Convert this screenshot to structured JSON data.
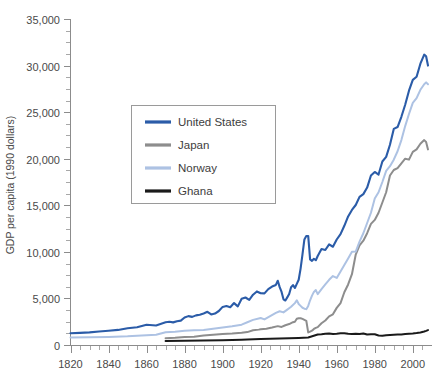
{
  "chart_data": {
    "type": "line",
    "title": "",
    "xlabel": "",
    "ylabel": "GDP per capita (1990 dollars)",
    "xlim": [
      1820,
      2008
    ],
    "ylim": [
      0,
      35000
    ],
    "grid": false,
    "legend_position": "upper-left-inset",
    "x_ticks": [
      1820,
      1840,
      1860,
      1880,
      1900,
      1920,
      1940,
      1960,
      1980,
      2000
    ],
    "x_tick_labels": [
      "1820",
      "1840",
      "1860",
      "1880",
      "1900",
      "1920",
      "1940",
      "1960",
      "1980",
      "2000"
    ],
    "x_minor_tick_interval": 5,
    "y_ticks": [
      0,
      5000,
      10000,
      15000,
      20000,
      25000,
      30000,
      35000
    ],
    "y_tick_labels": [
      "0",
      "5,000",
      "10,000",
      "15,000",
      "20,000",
      "25,000",
      "30,000",
      "35,000"
    ],
    "y_minor_tick_interval": 1250,
    "colors": {
      "united_states": "#2b5ca8",
      "japan": "#8d8d8d",
      "norway": "#adc2e3",
      "ghana": "#1a1a1a",
      "axis": "#8c8c8c",
      "text": "#4a4a4a",
      "legend_border": "#9a9a9a",
      "background": "#ffffff"
    },
    "series": [
      {
        "name": "United States",
        "color_key": "united_states",
        "x": [
          1820,
          1825,
          1830,
          1835,
          1840,
          1845,
          1850,
          1855,
          1860,
          1865,
          1870,
          1872,
          1874,
          1876,
          1878,
          1880,
          1882,
          1884,
          1886,
          1888,
          1890,
          1892,
          1894,
          1896,
          1898,
          1900,
          1902,
          1904,
          1906,
          1908,
          1910,
          1912,
          1914,
          1916,
          1918,
          1920,
          1922,
          1924,
          1926,
          1928,
          1929,
          1930,
          1931,
          1932,
          1933,
          1934,
          1935,
          1936,
          1937,
          1938,
          1939,
          1940,
          1941,
          1942,
          1943,
          1944,
          1945,
          1946,
          1947,
          1948,
          1949,
          1950,
          1952,
          1954,
          1956,
          1958,
          1960,
          1962,
          1964,
          1966,
          1968,
          1970,
          1972,
          1974,
          1976,
          1978,
          1980,
          1982,
          1984,
          1986,
          1988,
          1990,
          1992,
          1994,
          1996,
          1998,
          2000,
          2002,
          2004,
          2006,
          2007,
          2008
        ],
        "y": [
          1257,
          1300,
          1360,
          1450,
          1530,
          1620,
          1806,
          1900,
          2178,
          2100,
          2445,
          2500,
          2430,
          2550,
          2620,
          2950,
          3100,
          3020,
          3180,
          3250,
          3392,
          3560,
          3280,
          3380,
          3650,
          4091,
          4190,
          4060,
          4500,
          4150,
          4964,
          5100,
          4850,
          5400,
          5750,
          5552,
          5540,
          6000,
          6280,
          6450,
          6899,
          6213,
          5691,
          4908,
          4777,
          5114,
          5467,
          6204,
          6430,
          6126,
          6561,
          7010,
          8206,
          9741,
          11330,
          11709,
          11709,
          9197,
          9030,
          9260,
          9100,
          9561,
          10300,
          10200,
          10800,
          10550,
          11328,
          11900,
          12800,
          13800,
          14500,
          15030,
          15900,
          16200,
          16900,
          18200,
          18577,
          18300,
          19700,
          20200,
          21500,
          23201,
          23400,
          24500,
          25800,
          27300,
          28467,
          28800,
          30200,
          31178,
          31000,
          30000
        ]
      },
      {
        "name": "Japan",
        "color_key": "japan",
        "x": [
          1870,
          1875,
          1880,
          1885,
          1890,
          1895,
          1900,
          1905,
          1910,
          1913,
          1916,
          1919,
          1920,
          1923,
          1926,
          1929,
          1931,
          1933,
          1935,
          1937,
          1938,
          1939,
          1940,
          1941,
          1942,
          1943,
          1944,
          1945,
          1946,
          1947,
          1948,
          1949,
          1950,
          1952,
          1954,
          1956,
          1958,
          1960,
          1962,
          1964,
          1966,
          1968,
          1970,
          1972,
          1974,
          1976,
          1978,
          1980,
          1982,
          1984,
          1986,
          1988,
          1990,
          1992,
          1994,
          1996,
          1998,
          2000,
          2002,
          2004,
          2006,
          2007,
          2008
        ],
        "y": [
          737,
          780,
          850,
          880,
          1012,
          1100,
          1180,
          1230,
          1304,
          1387,
          1580,
          1650,
          1696,
          1740,
          1870,
          2026,
          1940,
          2120,
          2250,
          2450,
          2500,
          2816,
          2874,
          2873,
          2800,
          2700,
          2600,
          1346,
          1444,
          1541,
          1725,
          1844,
          1921,
          2336,
          2634,
          3068,
          3290,
          3986,
          4500,
          5668,
          6500,
          7600,
          9714,
          10700,
          11200,
          12000,
          13000,
          13428,
          14200,
          15300,
          16400,
          18200,
          18789,
          19000,
          19500,
          20000,
          19900,
          20738,
          21000,
          21600,
          22000,
          21800,
          21000
        ]
      },
      {
        "name": "Norway",
        "color_key": "norway",
        "x": [
          1820,
          1830,
          1840,
          1850,
          1860,
          1865,
          1870,
          1875,
          1880,
          1885,
          1890,
          1895,
          1900,
          1905,
          1910,
          1913,
          1916,
          1919,
          1920,
          1922,
          1925,
          1928,
          1930,
          1932,
          1934,
          1936,
          1938,
          1939,
          1940,
          1941,
          1942,
          1943,
          1944,
          1945,
          1946,
          1947,
          1948,
          1949,
          1950,
          1952,
          1954,
          1956,
          1958,
          1960,
          1962,
          1964,
          1966,
          1968,
          1970,
          1972,
          1974,
          1976,
          1978,
          1980,
          1982,
          1984,
          1986,
          1988,
          1990,
          1992,
          1994,
          1996,
          1998,
          2000,
          2002,
          2004,
          2006,
          2007,
          2008
        ],
        "y": [
          801,
          830,
          860,
          930,
          1049,
          1100,
          1360,
          1420,
          1519,
          1580,
          1617,
          1750,
          1877,
          2010,
          2186,
          2447,
          2700,
          2850,
          2900,
          2750,
          3100,
          3450,
          3626,
          3500,
          3800,
          4100,
          4500,
          4800,
          4400,
          4200,
          4000,
          3900,
          3850,
          4200,
          4800,
          5300,
          5700,
          5900,
          5463,
          6000,
          6500,
          7000,
          7400,
          7204,
          7900,
          8600,
          9300,
          10000,
          10033,
          11100,
          12000,
          13100,
          14200,
          15728,
          16400,
          17500,
          18700,
          19200,
          19900,
          20800,
          22000,
          23500,
          24800,
          26000,
          26500,
          27400,
          28000,
          28200,
          28000
        ]
      },
      {
        "name": "Ghana",
        "color_key": "ghana",
        "x": [
          1870,
          1880,
          1890,
          1900,
          1905,
          1910,
          1913,
          1920,
          1925,
          1930,
          1935,
          1940,
          1945,
          1950,
          1952,
          1954,
          1956,
          1958,
          1960,
          1962,
          1964,
          1966,
          1968,
          1970,
          1972,
          1974,
          1976,
          1978,
          1980,
          1982,
          1984,
          1986,
          1988,
          1990,
          1992,
          1994,
          1996,
          1998,
          2000,
          2002,
          2004,
          2006,
          2007,
          2008
        ],
        "y": [
          439,
          450,
          470,
          500,
          530,
          560,
          580,
          640,
          680,
          700,
          720,
          760,
          800,
          1122,
          1150,
          1200,
          1230,
          1180,
          1210,
          1250,
          1260,
          1200,
          1190,
          1220,
          1180,
          1240,
          1120,
          1150,
          1157,
          1020,
          1000,
          1050,
          1080,
          1100,
          1120,
          1140,
          1180,
          1220,
          1245,
          1290,
          1350,
          1450,
          1520,
          1600
        ]
      }
    ],
    "legend": [
      {
        "label": "United States",
        "color_key": "united_states"
      },
      {
        "label": "Japan",
        "color_key": "japan"
      },
      {
        "label": "Norway",
        "color_key": "norway"
      },
      {
        "label": "Ghana",
        "color_key": "ghana"
      }
    ]
  }
}
